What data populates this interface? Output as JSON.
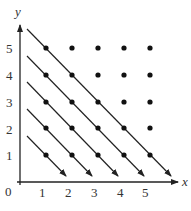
{
  "diagram": {
    "type": "lattice-points-with-diagonals",
    "axes": {
      "x_label": "x",
      "y_label": "y",
      "origin_label": "0",
      "x_ticks": [
        "1",
        "2",
        "3",
        "4",
        "5"
      ],
      "y_ticks": [
        "1",
        "2",
        "3",
        "4",
        "5"
      ]
    },
    "points": {
      "grid_min": 1,
      "grid_max": 5,
      "description": "All integer lattice points (i, j) with 1 ≤ i, j ≤ 5"
    },
    "diagonals": [
      {
        "sum": 2,
        "from": [
          1,
          1
        ],
        "to": [
          1,
          1
        ],
        "direction": "down-right"
      },
      {
        "sum": 3,
        "from": [
          1,
          2
        ],
        "to": [
          2,
          1
        ],
        "direction": "down-right"
      },
      {
        "sum": 4,
        "from": [
          1,
          3
        ],
        "to": [
          3,
          1
        ],
        "direction": "down-right"
      },
      {
        "sum": 5,
        "from": [
          1,
          4
        ],
        "to": [
          4,
          1
        ],
        "direction": "down-right"
      },
      {
        "sum": 6,
        "from": [
          1,
          5
        ],
        "to": [
          5,
          1
        ],
        "direction": "down-right"
      }
    ],
    "colors": {
      "ink": "#222222",
      "background": "#ffffff"
    }
  }
}
